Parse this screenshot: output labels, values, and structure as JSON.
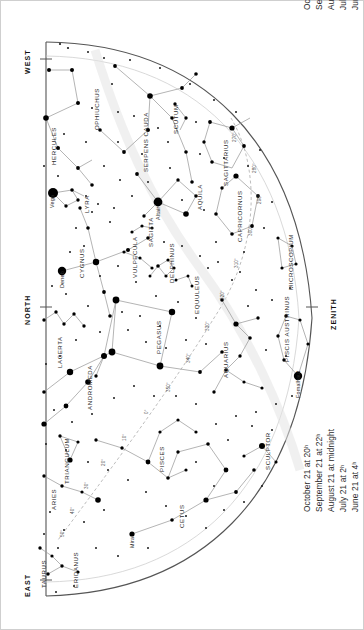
{
  "chart": {
    "orientation": "rotated-90",
    "horizon_shape": "half-dome",
    "cardinals": [
      {
        "name": "WEST",
        "x": 22,
        "y": 58
      },
      {
        "name": "NORTH",
        "x": 22,
        "y": 307
      },
      {
        "name": "EAST",
        "x": 22,
        "y": 580
      },
      {
        "name": "ZENITH",
        "x": 330,
        "y": 307
      }
    ],
    "date_block_top": {
      "lines": [
        "June 6 at   5ʰ",
        "July 6 at   3ʰ",
        "August 6 at   1ʰ",
        "September 6 at 23ʰ",
        "October 6 at 21ʰ"
      ]
    },
    "date_block_bottom": {
      "lines": [
        "June 21 at    4ʰ",
        "July 21 at    2ʰ",
        "August 21 at midnight",
        "September 21 at    22ʰ",
        "October 21 at    20ʰ"
      ]
    },
    "constellations": [
      {
        "name": "OPHIUCHUS",
        "x": 93,
        "y": 96
      },
      {
        "name": "HERCULES",
        "x": 50,
        "y": 135
      },
      {
        "name": "SERPENS CAUDA",
        "x": 142,
        "y": 128
      },
      {
        "name": "SCUTUM",
        "x": 172,
        "y": 110
      },
      {
        "name": "SAGITTARIUS",
        "x": 222,
        "y": 147
      },
      {
        "name": "CAPRICORNUS",
        "x": 236,
        "y": 200
      },
      {
        "name": "AQUILA",
        "x": 196,
        "y": 189
      },
      {
        "name": "LYRA",
        "x": 83,
        "y": 196
      },
      {
        "name": "CYGNUS",
        "x": 78,
        "y": 255
      },
      {
        "name": "VULPECULA",
        "x": 131,
        "y": 248
      },
      {
        "name": "SAGITTA",
        "x": 147,
        "y": 225
      },
      {
        "name": "DELPHINUS",
        "x": 168,
        "y": 253
      },
      {
        "name": "EQUULEUS",
        "x": 193,
        "y": 287
      },
      {
        "name": "MICROSCOPIUM",
        "x": 287,
        "y": 251
      },
      {
        "name": "PISCIS AUSTRINUS",
        "x": 283,
        "y": 318
      },
      {
        "name": "PEGASUS",
        "x": 155,
        "y": 330
      },
      {
        "name": "AQUARIUS",
        "x": 222,
        "y": 348
      },
      {
        "name": "LACERTA",
        "x": 56,
        "y": 343
      },
      {
        "name": "ANDROMEDA",
        "x": 86,
        "y": 377
      },
      {
        "name": "TRIANGULUM",
        "x": 63,
        "y": 451
      },
      {
        "name": "ARIES",
        "x": 50,
        "y": 492
      },
      {
        "name": "PISCES",
        "x": 158,
        "y": 450
      },
      {
        "name": "SCULPTOR",
        "x": 264,
        "y": 442
      },
      {
        "name": "CETUS",
        "x": 178,
        "y": 508
      },
      {
        "name": "ERIDANUS",
        "x": 72,
        "y": 560
      },
      {
        "name": "TAURUS",
        "x": 40,
        "y": 566
      }
    ],
    "named_stars": [
      {
        "name": "Vega",
        "x": 53,
        "y": 193,
        "mag": 0.0
      },
      {
        "name": "Deneb",
        "x": 62,
        "y": 271,
        "mag": 1.2
      },
      {
        "name": "Altair",
        "x": 158,
        "y": 202,
        "mag": 0.8
      },
      {
        "name": "Fomalhaut",
        "x": 298,
        "y": 376,
        "mag": 1.2
      },
      {
        "name": "Mira",
        "x": 132,
        "y": 534,
        "mag": 3.0
      }
    ],
    "ecliptic_marks": [
      {
        "label": "270°",
        "x": 232,
        "y": 131
      },
      {
        "label": "280°",
        "x": 252,
        "y": 162
      },
      {
        "label": "290°",
        "x": 257,
        "y": 193
      },
      {
        "label": "300°",
        "x": 248,
        "y": 225
      },
      {
        "label": "310°",
        "x": 234,
        "y": 257
      },
      {
        "label": "320°",
        "x": 220,
        "y": 289
      },
      {
        "label": "330°",
        "x": 205,
        "y": 320
      },
      {
        "label": "340°",
        "x": 186,
        "y": 352
      },
      {
        "label": "350°",
        "x": 166,
        "y": 381
      },
      {
        "label": "0°",
        "x": 144,
        "y": 406
      },
      {
        "label": "10°",
        "x": 122,
        "y": 432
      },
      {
        "label": "20°",
        "x": 101,
        "y": 457
      },
      {
        "label": "30°",
        "x": 84,
        "y": 480
      },
      {
        "label": "40°",
        "x": 70,
        "y": 505
      },
      {
        "label": "50°",
        "x": 60,
        "y": 528
      }
    ],
    "colors": {
      "background": "#ffffff",
      "star": "#000000",
      "line": "#999999",
      "horizon": "#444444",
      "ecliptic": "#aaaaaa",
      "text": "#2b2b2b"
    }
  }
}
